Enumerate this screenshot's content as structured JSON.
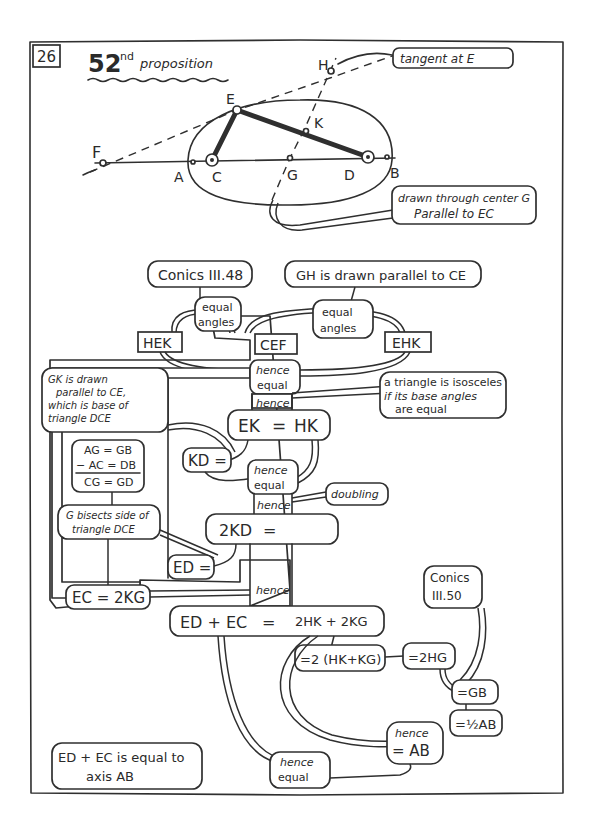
{
  "page": {
    "page_number": "26",
    "title_number": "52",
    "title_suffix": "nd",
    "title_text": "proposition"
  },
  "figure": {
    "points": {
      "F": "F",
      "A": "A",
      "C": "C",
      "E": "E",
      "K": "K",
      "G": "G",
      "D": "D",
      "B": "B",
      "H": "H"
    },
    "notes": {
      "tangent": "tangent at E",
      "through_center_line1": "drawn through center G",
      "through_center_line2": "Parallel to EC"
    }
  },
  "flow": {
    "conics_iii_48": "Conics III.48",
    "gh_parallel": "GH is drawn parallel to CE",
    "equal_angles_1_l1": "equal",
    "equal_angles_1_l2": "angles",
    "equal_angles_2_l1": "equal",
    "equal_angles_2_l2": "angles",
    "angle_hek": "HEK",
    "angle_cef": "CEF",
    "angle_ehk": "EHK",
    "hence_equal_1_l1": "hence",
    "hence_equal_1_l2": "equal",
    "isosceles_l1": "a triangle is isosceles",
    "isosceles_l2": "if its base angles",
    "isosceles_l3": "are equal",
    "hence_1": "hence",
    "ek_eq_hk_left": "EK",
    "ek_eq_hk_eq": "=",
    "ek_eq_hk_right": "HK",
    "gk_note_l1": "GK is drawn",
    "gk_note_l2": "parallel to CE,",
    "gk_note_l3": "which is base of",
    "gk_note_l4": "triangle DCE",
    "sub_l1": "AG = GB",
    "sub_l2": "− AC = DB",
    "sub_l3": "CG = GD",
    "bisects_l1": "G bisects side of",
    "bisects_l2": "triangle DCE",
    "kd_eq": "KD =",
    "hence_equal_2_l1": "hence",
    "hence_equal_2_l2": "equal",
    "doubling": "doubling",
    "hence_2": "hence",
    "two_kd_left": "2KD",
    "two_kd_eq": "=",
    "two_kd_right": "2HK",
    "ed_eq": "ED =",
    "ec_eq_2kg": "EC = 2KG",
    "hence_3": "hence",
    "sum_left": "ED + EC",
    "sum_eq": "=",
    "sum_right": "2HK + 2KG",
    "factor": "=2 (HK+KG)",
    "two_hg": "=2HG",
    "conics_iii_50_l1": "Conics",
    "conics_iii_50_l2": "III.50",
    "eq_gb": "=GB",
    "eq_half_ab": "=½AB",
    "hence_ab_l1": "hence",
    "hence_ab_l2": "= AB",
    "hence_equal_3_l1": "hence",
    "hence_equal_3_l2": "equal",
    "conclusion_l1": "ED + EC is equal to",
    "conclusion_l2": "axis AB"
  }
}
